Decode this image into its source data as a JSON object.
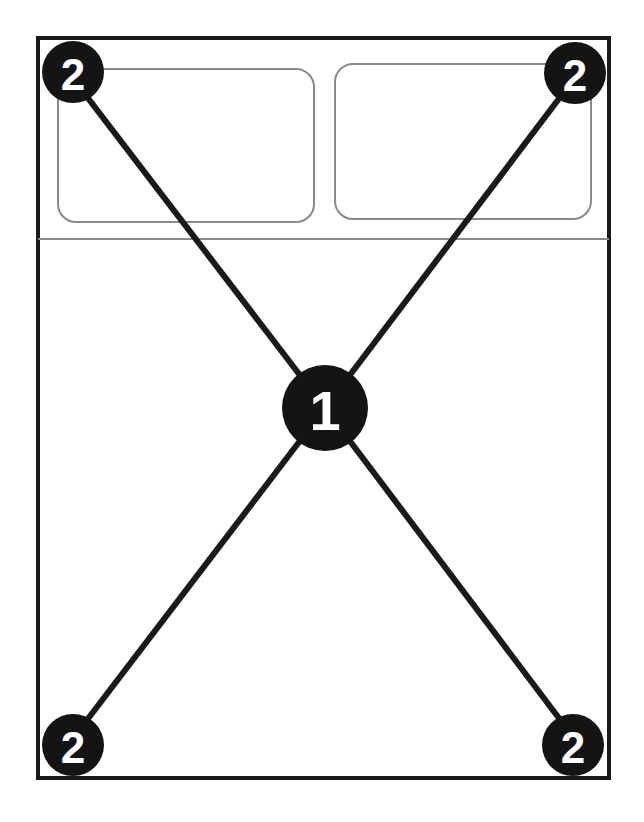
{
  "figure": {
    "background_color": "#ffffff",
    "line_color": "#1a1a1a",
    "thin_line_color": "#8a8a8a",
    "marker_fill_color": "#141414",
    "marker_text_color": "#ffffff",
    "width": 644,
    "height": 822
  },
  "outline": {
    "name": "outer-rectangle",
    "x": 38,
    "y": 38,
    "width": 571,
    "height": 740,
    "stroke_width": 4
  },
  "divider": {
    "name": "horizontal-divider",
    "x1": 38,
    "y1": 239,
    "x2": 609,
    "y2": 239,
    "stroke_width": 2
  },
  "panels": [
    {
      "name": "left-rounded-panel",
      "x": 58,
      "y": 69,
      "width": 256,
      "height": 153,
      "rx": 18,
      "stroke_width": 2
    },
    {
      "name": "right-rounded-panel",
      "x": 335,
      "y": 64,
      "width": 256,
      "height": 155,
      "rx": 18,
      "stroke_width": 2
    }
  ],
  "leader_lines": [
    {
      "name": "leader-top-left-to-center",
      "x1": 55,
      "y1": 55,
      "x2": 325,
      "y2": 408,
      "stroke_width": 6
    },
    {
      "name": "leader-top-right-to-center",
      "x1": 592,
      "y1": 55,
      "x2": 325,
      "y2": 408,
      "stroke_width": 6
    },
    {
      "name": "leader-bottom-left-to-center",
      "x1": 55,
      "y1": 762,
      "x2": 325,
      "y2": 408,
      "stroke_width": 6
    },
    {
      "name": "leader-bottom-right-to-center",
      "x1": 592,
      "y1": 762,
      "x2": 325,
      "y2": 408,
      "stroke_width": 6
    }
  ],
  "markers": [
    {
      "name": "callout-marker-center",
      "label": "1",
      "cx": 325,
      "cy": 408,
      "r": 43,
      "size": "center"
    },
    {
      "name": "callout-marker-top-left",
      "label": "2",
      "cx": 73,
      "cy": 72,
      "r": 31,
      "size": "corner"
    },
    {
      "name": "callout-marker-top-right",
      "label": "2",
      "cx": 575,
      "cy": 73,
      "r": 31,
      "size": "corner"
    },
    {
      "name": "callout-marker-bottom-left",
      "label": "2",
      "cx": 73,
      "cy": 745,
      "r": 31,
      "size": "corner"
    },
    {
      "name": "callout-marker-bottom-right",
      "label": "2",
      "cx": 573,
      "cy": 745,
      "r": 31,
      "size": "corner"
    }
  ],
  "legend": {
    "item_1": "1",
    "item_2": "2"
  }
}
